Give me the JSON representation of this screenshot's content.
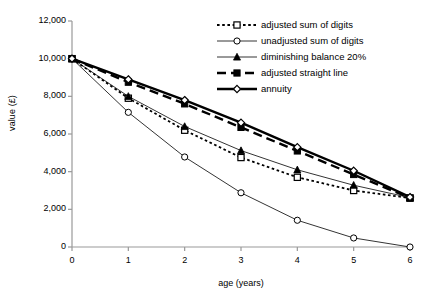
{
  "chart_data": {
    "type": "line",
    "title": "",
    "xlabel": "age (years)",
    "ylabel": "value (£)",
    "x": [
      0,
      1,
      2,
      3,
      4,
      5,
      6
    ],
    "xlim": [
      0,
      6
    ],
    "ylim": [
      0,
      12000
    ],
    "xticks": [
      "0",
      "1",
      "2",
      "3",
      "4",
      "5",
      "6"
    ],
    "yticks": [
      "0",
      "2,000",
      "4,000",
      "6,000",
      "8,000",
      "10,000",
      "12,000"
    ],
    "ytick_values": [
      0,
      2000,
      4000,
      6000,
      8000,
      10000,
      12000
    ],
    "grid": false,
    "legend_position": "top-right",
    "series": [
      {
        "name": "adjusted sum of digits",
        "marker": "open-square",
        "line": "dotted",
        "line_width": 1.8,
        "color": "#000000",
        "values": [
          10000,
          7900,
          6200,
          4750,
          3700,
          3000,
          2600
        ]
      },
      {
        "name": "unadjusted sum of digits",
        "marker": "open-circle",
        "line": "solid-thin",
        "line_width": 0.8,
        "color": "#000000",
        "values": [
          10000,
          7150,
          4780,
          2880,
          1420,
          480,
          0
        ]
      },
      {
        "name": "diminishing balance 20%",
        "marker": "filled-triangle",
        "line": "solid-thin",
        "line_width": 0.8,
        "color": "#000000",
        "values": [
          10000,
          8000,
          6400,
          5120,
          4100,
          3280,
          2620
        ]
      },
      {
        "name": "adjusted straight line",
        "marker": "filled-square",
        "line": "dashed-thick",
        "line_width": 2.4,
        "color": "#000000",
        "values": [
          10000,
          8750,
          7600,
          6350,
          5100,
          3850,
          2600
        ]
      },
      {
        "name": "annuity",
        "marker": "open-diamond",
        "line": "solid-thick",
        "line_width": 2.4,
        "color": "#000000",
        "values": [
          10000,
          8900,
          7800,
          6600,
          5300,
          4050,
          2650
        ]
      }
    ]
  },
  "legend": {
    "items": [
      {
        "label": "adjusted sum of digits"
      },
      {
        "label": "unadjusted sum of digits"
      },
      {
        "label": "diminishing balance 20%"
      },
      {
        "label": "adjusted straight line"
      },
      {
        "label": "annuity"
      }
    ]
  },
  "axes": {
    "axis_color": "#999999",
    "plot_color": "#000000"
  }
}
